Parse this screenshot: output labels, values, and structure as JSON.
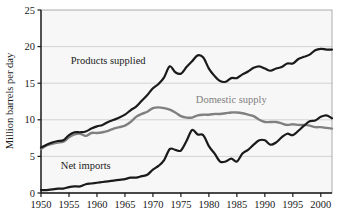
{
  "chart_data": {
    "type": "line",
    "title": "",
    "xlabel": "",
    "ylabel": "Million barrels per day",
    "xlim": [
      1950,
      2002
    ],
    "ylim": [
      0,
      25
    ],
    "grid": true,
    "legend_position": "inline-annotations",
    "xticks": [
      "1950",
      "1955",
      "1960",
      "1965",
      "1970",
      "1975",
      "1980",
      "1985",
      "1990",
      "1995",
      "2000"
    ],
    "xtick_values": [
      1950,
      1955,
      1960,
      1965,
      1970,
      1975,
      1980,
      1985,
      1990,
      1995,
      2000
    ],
    "yticks": [
      "0",
      "5",
      "10",
      "15",
      "20",
      "25"
    ],
    "ytick_values": [
      0,
      5,
      10,
      15,
      20,
      25
    ],
    "x": [
      1950,
      1951,
      1952,
      1953,
      1954,
      1955,
      1956,
      1957,
      1958,
      1959,
      1960,
      1961,
      1962,
      1963,
      1964,
      1965,
      1966,
      1967,
      1968,
      1969,
      1970,
      1971,
      1972,
      1973,
      1974,
      1975,
      1976,
      1977,
      1978,
      1979,
      1980,
      1981,
      1982,
      1983,
      1984,
      1985,
      1986,
      1987,
      1988,
      1989,
      1990,
      1991,
      1992,
      1993,
      1994,
      1995,
      1996,
      1997,
      1998,
      1999,
      2000,
      2001,
      2002
    ],
    "series": [
      {
        "name": "Products supplied",
        "color": "#1a1a1a",
        "label_x": 1962.0,
        "label_y": 17.6,
        "values": [
          6.2,
          6.6,
          6.9,
          7.1,
          7.2,
          7.9,
          8.3,
          8.3,
          8.4,
          8.8,
          9.1,
          9.3,
          9.7,
          10.0,
          10.3,
          10.7,
          11.3,
          11.8,
          12.6,
          13.4,
          14.3,
          14.9,
          15.8,
          17.3,
          16.5,
          16.3,
          17.2,
          18.0,
          18.8,
          18.5,
          17.0,
          16.0,
          15.3,
          15.2,
          15.7,
          15.7,
          16.2,
          16.6,
          17.1,
          17.3,
          17.0,
          16.7,
          17.0,
          17.2,
          17.7,
          17.7,
          18.3,
          18.6,
          18.9,
          19.5,
          19.7,
          19.6,
          19.6
        ]
      },
      {
        "name": "Domestic supply",
        "color": "#808080",
        "label_x": 1984.0,
        "label_y": 12.3,
        "values": [
          6.0,
          6.5,
          6.7,
          6.9,
          7.0,
          7.6,
          8.0,
          8.1,
          7.8,
          8.2,
          8.2,
          8.3,
          8.5,
          8.8,
          9.0,
          9.2,
          9.7,
          10.4,
          10.8,
          11.1,
          11.6,
          11.7,
          11.6,
          11.4,
          11.0,
          10.5,
          10.3,
          10.3,
          10.6,
          10.7,
          10.7,
          10.8,
          10.8,
          10.9,
          11.0,
          11.0,
          10.9,
          10.7,
          10.5,
          10.0,
          9.7,
          9.7,
          9.7,
          9.5,
          9.3,
          9.4,
          9.3,
          9.3,
          9.2,
          9.0,
          9.0,
          8.9,
          8.8
        ]
      },
      {
        "name": "Net imports",
        "color": "#1a1a1a",
        "label_x": 1958.0,
        "label_y": 3.3,
        "values": [
          0.4,
          0.4,
          0.5,
          0.6,
          0.6,
          0.8,
          0.9,
          0.9,
          1.2,
          1.3,
          1.4,
          1.5,
          1.6,
          1.7,
          1.8,
          1.9,
          2.1,
          2.1,
          2.3,
          2.5,
          3.2,
          3.7,
          4.5,
          6.0,
          5.9,
          5.8,
          7.1,
          8.6,
          8.0,
          7.9,
          6.4,
          5.4,
          4.3,
          4.3,
          4.7,
          4.3,
          5.4,
          5.9,
          6.6,
          7.2,
          7.2,
          6.6,
          6.9,
          7.6,
          8.1,
          7.9,
          8.5,
          9.2,
          9.8,
          9.9,
          10.4,
          10.6,
          10.2
        ]
      }
    ]
  }
}
